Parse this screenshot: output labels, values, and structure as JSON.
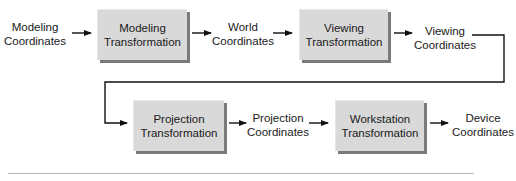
{
  "diagram": {
    "nodes": [
      {
        "id": "modeling-coordinates",
        "type": "label",
        "lines": [
          "Modeling",
          "Coordinates"
        ]
      },
      {
        "id": "modeling-transformation",
        "type": "box",
        "lines": [
          "Modeling",
          "Transformation"
        ]
      },
      {
        "id": "world-coordinates",
        "type": "label",
        "lines": [
          "World",
          "Coordinates"
        ]
      },
      {
        "id": "viewing-transformation",
        "type": "box",
        "lines": [
          "Viewing",
          "Transformation"
        ]
      },
      {
        "id": "viewing-coordinates",
        "type": "label",
        "lines": [
          "Viewing",
          "Coordinates"
        ]
      },
      {
        "id": "projection-transformation",
        "type": "box",
        "lines": [
          "Projection",
          "Transformation"
        ]
      },
      {
        "id": "projection-coordinates",
        "type": "label",
        "lines": [
          "Projection",
          "Coordinates"
        ]
      },
      {
        "id": "workstation-transformation",
        "type": "box",
        "lines": [
          "Workstation",
          "Transformation"
        ]
      },
      {
        "id": "device-coordinates",
        "type": "label",
        "lines": [
          "Device",
          "Coordinates"
        ]
      }
    ],
    "edges": [
      [
        "modeling-coordinates",
        "modeling-transformation"
      ],
      [
        "modeling-transformation",
        "world-coordinates"
      ],
      [
        "world-coordinates",
        "viewing-transformation"
      ],
      [
        "viewing-transformation",
        "viewing-coordinates"
      ],
      [
        "viewing-coordinates",
        "projection-transformation"
      ],
      [
        "projection-transformation",
        "projection-coordinates"
      ],
      [
        "projection-coordinates",
        "workstation-transformation"
      ],
      [
        "workstation-transformation",
        "device-coordinates"
      ]
    ],
    "colors": {
      "box_fill": "#d9d9d9",
      "box_shadow": "#7a7a7a",
      "line": "#111111",
      "rule": "#b8b8b8"
    }
  }
}
